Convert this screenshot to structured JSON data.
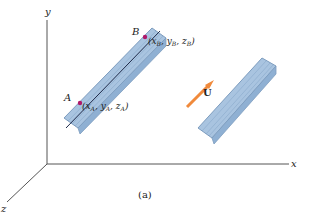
{
  "axes": {
    "x_label": "x",
    "y_label": "y",
    "z_label": "z"
  },
  "rod_left": {
    "point_a": {
      "label": "A",
      "coords": "(x_A, y_A, z_A)",
      "coord_text": "(xA, yA, zA)"
    },
    "point_b": {
      "label": "B",
      "coords": "(x_B, y_B, z_B)",
      "coord_text": "(xB, yB, zB)"
    }
  },
  "rod_right": {
    "vector_label": "U"
  },
  "caption": "(a)",
  "colors": {
    "rod_fill": "#a9c4e0",
    "rod_edge": "#7e9dbf",
    "point_color": "#b0186a",
    "arrow_color": "#f08a3c",
    "axis_color": "#555555"
  }
}
